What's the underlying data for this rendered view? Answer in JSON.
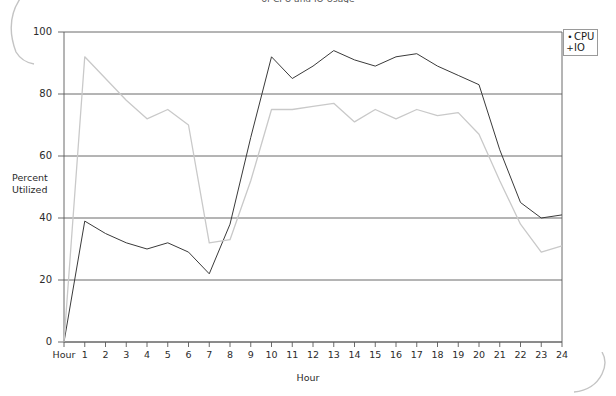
{
  "title": "of CPU and IO Usage",
  "axes": {
    "y_label_line1": "Percent",
    "y_label_line2": "Utilized",
    "x_label": "Hour",
    "x_origin_label": "Hour",
    "y_ticks": [
      "0",
      "20",
      "40",
      "60",
      "80",
      "100"
    ],
    "x_ticks": [
      "1",
      "2",
      "3",
      "4",
      "5",
      "6",
      "7",
      "8",
      "9",
      "10",
      "11",
      "12",
      "13",
      "14",
      "15",
      "16",
      "17",
      "18",
      "19",
      "20",
      "21",
      "22",
      "23",
      "24"
    ]
  },
  "legend": {
    "position": "top-right",
    "entries": [
      {
        "label": "CPU",
        "marker": "dot-marker",
        "marker_glyph": "•",
        "color": "#3a3a3a"
      },
      {
        "label": "IO",
        "marker": "plus-marker",
        "marker_glyph": "+",
        "color": "#c9c9c9"
      }
    ]
  },
  "chart_data": {
    "type": "line",
    "title": "of CPU and IO Usage",
    "xlabel": "Hour",
    "ylabel": "Percent Utilized",
    "xlim": [
      0,
      24
    ],
    "ylim": [
      0,
      100
    ],
    "grid": true,
    "x": [
      0,
      1,
      2,
      3,
      4,
      5,
      6,
      7,
      8,
      9,
      10,
      11,
      12,
      13,
      14,
      15,
      16,
      17,
      18,
      19,
      20,
      21,
      22,
      23,
      24
    ],
    "series": [
      {
        "name": "CPU",
        "color": "#3a3a3a",
        "values": [
          0,
          39,
          35,
          32,
          30,
          32,
          29,
          22,
          38,
          66,
          92,
          85,
          89,
          94,
          91,
          89,
          92,
          93,
          89,
          86,
          83,
          62,
          45,
          40,
          41
        ]
      },
      {
        "name": "IO",
        "color": "#c9c9c9",
        "values": [
          0,
          92,
          85,
          78,
          72,
          75,
          70,
          32,
          33,
          52,
          75,
          75,
          76,
          77,
          71,
          75,
          72,
          75,
          73,
          74,
          67,
          52,
          38,
          29,
          31
        ]
      }
    ]
  }
}
